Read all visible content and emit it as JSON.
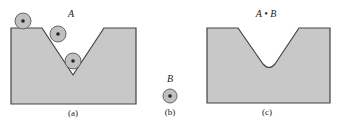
{
  "figure": {
    "panel_a": {
      "set_label": "A",
      "caption": "(a)"
    },
    "panel_b": {
      "set_label": "B",
      "caption": "(b)"
    },
    "panel_c": {
      "set_label": "A • B",
      "caption": "(c)"
    }
  },
  "colors": {
    "fill": "#c8c8c8",
    "stroke": "#444444",
    "disk_fill": "#c0c0c0",
    "disk_stroke": "#666666",
    "center_dot": "#222222"
  }
}
